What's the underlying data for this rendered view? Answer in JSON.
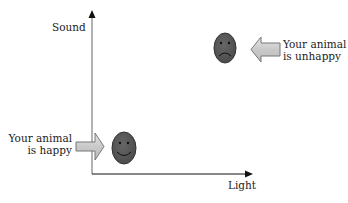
{
  "axes": {
    "y_label": "Sound",
    "x_label": "Light"
  },
  "annotations": {
    "unhappy": {
      "line1": "Your animal",
      "line2": "is unhappy",
      "face": "sad-face-icon",
      "arrow_direction": "left"
    },
    "happy": {
      "line1": "Your animal",
      "line2": "is happy",
      "face": "smiley-face-icon",
      "arrow_direction": "right"
    }
  },
  "colors": {
    "face_fill": "#5a5a5a",
    "face_stroke": "#333333",
    "arrow_fill": "#cfcfcf",
    "arrow_stroke": "#777777",
    "axis": "#111111",
    "y_axis": "#888888"
  }
}
